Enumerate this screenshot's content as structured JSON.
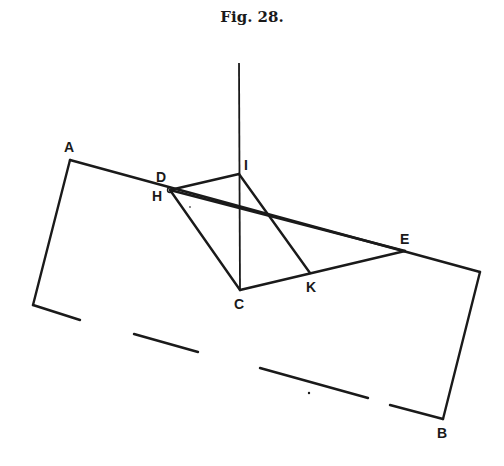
{
  "figure": {
    "title": "Fig. 28."
  },
  "points": {
    "A": {
      "label": "A",
      "x": 70,
      "y": 160
    },
    "B": {
      "label": "B",
      "x": 443,
      "y": 419
    },
    "C": {
      "label": "C",
      "x": 240,
      "y": 290
    },
    "D": {
      "label": "D",
      "x": 170,
      "y": 190
    },
    "H": {
      "label": "H",
      "x": 170,
      "y": 190
    },
    "E": {
      "label": "E",
      "x": 405,
      "y": 251
    },
    "I": {
      "label": "I",
      "x": 239,
      "y": 174
    },
    "K": {
      "label": "K",
      "x": 310,
      "y": 273
    }
  },
  "labels": {
    "A": "A",
    "B": "B",
    "C": "C",
    "D": "D",
    "H": "H",
    "E": "E",
    "I": "I",
    "K": "K"
  }
}
